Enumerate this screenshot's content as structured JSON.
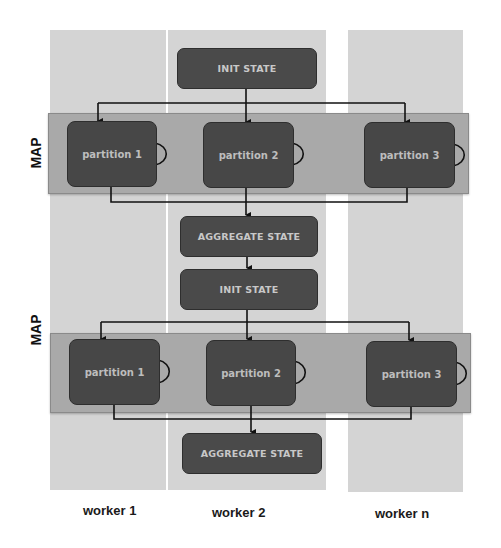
{
  "diagram": {
    "workers": [
      {
        "label": "worker 1"
      },
      {
        "label": "worker 2"
      },
      {
        "label": "worker n"
      }
    ],
    "stages": [
      {
        "type": "init",
        "label": "INIT STATE"
      },
      {
        "type": "map",
        "label": "MAP",
        "partitions": [
          "partition 1",
          "partition 2",
          "partition 3"
        ]
      },
      {
        "type": "aggregate",
        "label": "AGGREGATE STATE"
      },
      {
        "type": "init",
        "label": "INIT STATE"
      },
      {
        "type": "map",
        "label": "MAP",
        "partitions": [
          "partition 1",
          "partition 2",
          "partition 3"
        ]
      },
      {
        "type": "aggregate",
        "label": "AGGREGATE STATE"
      }
    ],
    "colors": {
      "worker_column": "#d4d4d4",
      "map_band": "#a9a9a9",
      "node_fill": "#4a4a4a",
      "node_text": "#c8c8c8",
      "edge": "#111111"
    }
  }
}
